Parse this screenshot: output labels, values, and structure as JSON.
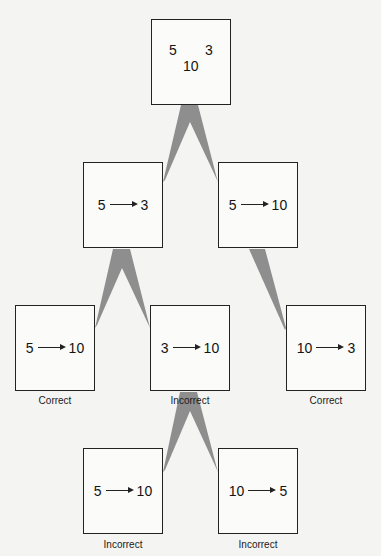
{
  "diagram": {
    "type": "search-tree",
    "colors": {
      "connector": "#8e8e8e",
      "box_border": "#222222",
      "background": "#f4f4f2"
    },
    "root": {
      "values": {
        "left": "5",
        "right": "3",
        "bottom": "10"
      }
    },
    "nodes": [
      {
        "id": "l2-left",
        "from": "5",
        "to": "3",
        "label": ""
      },
      {
        "id": "l2-right",
        "from": "5",
        "to": "10",
        "label": ""
      },
      {
        "id": "l3-left",
        "from": "5",
        "to": "10",
        "label": "Correct"
      },
      {
        "id": "l3-middle",
        "from": "3",
        "to": "10",
        "label": "Incorrect"
      },
      {
        "id": "l3-right",
        "from": "10",
        "to": "3",
        "label": "Correct"
      },
      {
        "id": "l4-left",
        "from": "5",
        "to": "10",
        "label": "Incorrect"
      },
      {
        "id": "l4-right",
        "from": "10",
        "to": "5",
        "label": "Incorrect"
      }
    ],
    "edges": [
      [
        "root",
        "l2-left"
      ],
      [
        "root",
        "l2-right"
      ],
      [
        "l2-left",
        "l3-left"
      ],
      [
        "l2-left",
        "l3-middle"
      ],
      [
        "l2-right",
        "l3-right"
      ],
      [
        "l3-middle",
        "l4-left"
      ],
      [
        "l3-middle",
        "l4-right"
      ]
    ]
  }
}
